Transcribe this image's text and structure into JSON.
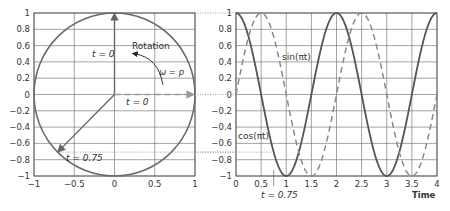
{
  "chart_data": [
    {
      "type": "line",
      "title": "",
      "description": "Unit circle with rotating vector (phasor)",
      "xlabel": "",
      "ylabel": "",
      "xlim": [
        -1,
        1
      ],
      "ylim": [
        -1,
        1
      ],
      "x_ticks": [
        "-1",
        "-0.5",
        "0",
        "0.5",
        "1"
      ],
      "y_ticks": [
        "1",
        "0.8",
        "0.6",
        "0.4",
        "0.2",
        "0",
        "-0.2",
        "-0.4",
        "-0.6",
        "-0.8",
        "-1"
      ],
      "grid": true,
      "series": [
        {
          "name": "unit circle",
          "style": "solid",
          "shape": "circle",
          "center": [
            0,
            0
          ],
          "radius": 1
        }
      ],
      "vectors": [
        {
          "name": "t = 0 (vertical)",
          "from": [
            0,
            0
          ],
          "to": [
            0,
            1
          ],
          "style": "solid",
          "label": "t = 0"
        },
        {
          "name": "t = 0 (horizontal)",
          "from": [
            0,
            0
          ],
          "to": [
            1,
            0
          ],
          "style": "dashed",
          "label": "t = 0"
        },
        {
          "name": "t = 0.75",
          "from": [
            0,
            0
          ],
          "to": [
            -0.707,
            -0.707
          ],
          "style": "solid",
          "label": "t = 0.75"
        }
      ],
      "annotations": [
        "Rotation",
        "ω = p",
        "t = 0",
        "t = 0",
        "t = 0.75"
      ]
    },
    {
      "type": "line",
      "title": "",
      "xlabel": "Time",
      "ylabel": "",
      "xlim": [
        0,
        4
      ],
      "ylim": [
        -1,
        1
      ],
      "x_ticks": [
        "0",
        "0.5",
        "1",
        "1.5",
        "2",
        "2.5",
        "3",
        "3.5",
        "4"
      ],
      "y_ticks": [
        "1",
        "0.8",
        "0.6",
        "0.4",
        "0.2",
        "0",
        "-0.2",
        "-0.4",
        "-0.6",
        "-0.8",
        "-1"
      ],
      "grid": true,
      "x": [
        0,
        0.25,
        0.5,
        0.75,
        1,
        1.25,
        1.5,
        1.75,
        2,
        2.25,
        2.5,
        2.75,
        3,
        3.25,
        3.5,
        3.75,
        4
      ],
      "series": [
        {
          "name": "cos(πt)",
          "style": "solid",
          "values": [
            1,
            0.707,
            0,
            -0.707,
            -1,
            -0.707,
            0,
            0.707,
            1,
            0.707,
            0,
            -0.707,
            -1,
            -0.707,
            0,
            0.707,
            1
          ]
        },
        {
          "name": "sin(πt)",
          "style": "dashed",
          "values": [
            0,
            0.707,
            1,
            0.707,
            0,
            -0.707,
            -1,
            -0.707,
            0,
            0.707,
            1,
            0.707,
            0,
            -0.707,
            -1,
            -0.707,
            0
          ]
        }
      ],
      "annotations": [
        "sin(πt)",
        "cos(πt)",
        "t = 0.75",
        "Time"
      ],
      "marker": {
        "x": 0.75,
        "label": "t = 0.75"
      }
    }
  ],
  "labels": {
    "rotation": "Rotation",
    "omega": "ω = p",
    "t0_vertical": "t = 0",
    "t0_horizontal": "t = 0",
    "t075_left": "t = 0.75",
    "sin_label": "sin(πt)",
    "cos_label": "cos(πt)",
    "t075_bottom": "t = 0.75",
    "time_axis": "Time"
  },
  "colors": {
    "circle": "#6b6b6b",
    "cos": "#555555",
    "sin": "#8a8a8a",
    "grid": "#666666",
    "text": "#333333"
  }
}
